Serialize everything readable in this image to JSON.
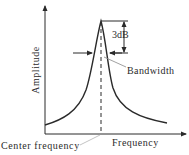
{
  "diagram": {
    "labels": {
      "y_axis": "Amplitude",
      "x_axis": "Frequency",
      "center_frequency": "Center frequency",
      "bandwidth": "Bandwidth",
      "db_drop": "3dB"
    },
    "colors": {
      "line": "#2a2a2a",
      "background": "#ffffff",
      "leader": "#888888"
    }
  }
}
